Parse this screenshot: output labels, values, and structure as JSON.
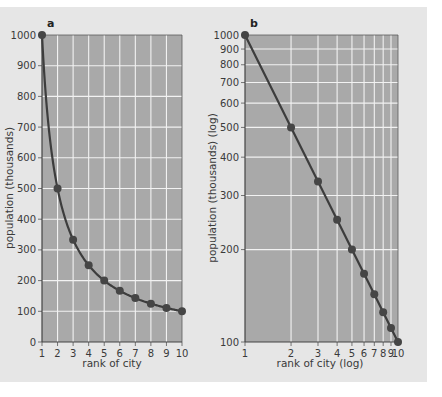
{
  "colors": {
    "background": "#e6e6e6",
    "plot_area": "#a9a9a9",
    "grid": "#f2f2f2",
    "line": "#3d3d3d",
    "marker": "#454545"
  },
  "chart_data": [
    {
      "panel": "a",
      "type": "line",
      "title": "a",
      "xlabel": "rank of city",
      "ylabel": "population (thousands)",
      "x": [
        1,
        2,
        3,
        4,
        5,
        6,
        7,
        8,
        9,
        10
      ],
      "series": [
        {
          "name": "population",
          "values": [
            1000,
            500,
            333,
            250,
            200,
            167,
            143,
            125,
            111,
            100
          ]
        }
      ],
      "xlim": [
        1,
        10
      ],
      "ylim": [
        0,
        1000
      ],
      "xticks": [
        "1",
        "2",
        "3",
        "4",
        "5",
        "6",
        "7",
        "8",
        "9",
        "10"
      ],
      "yticks": [
        "0",
        "100",
        "200",
        "300",
        "400",
        "500",
        "600",
        "700",
        "800",
        "900",
        "1000"
      ],
      "xscale": "linear",
      "yscale": "linear",
      "grid": true,
      "legend": null
    },
    {
      "panel": "b",
      "type": "line",
      "title": "b",
      "xlabel": "rank of city (log)",
      "ylabel": "population (thousands) (log)",
      "x": [
        1,
        2,
        3,
        4,
        5,
        6,
        7,
        8,
        9,
        10
      ],
      "series": [
        {
          "name": "population",
          "values": [
            1000,
            500,
            333,
            250,
            200,
            167,
            143,
            125,
            111,
            100
          ]
        }
      ],
      "xlim": [
        1,
        10
      ],
      "ylim": [
        100,
        1000
      ],
      "xticks": [
        "1",
        "2",
        "3",
        "4",
        "5",
        "6",
        "7",
        "8",
        "9",
        "10"
      ],
      "yticks": [
        "100",
        "200",
        "300",
        "400",
        "500",
        "600",
        "700",
        "800",
        "900",
        "1000"
      ],
      "xscale": "log",
      "yscale": "log",
      "grid": true,
      "legend": null
    }
  ]
}
